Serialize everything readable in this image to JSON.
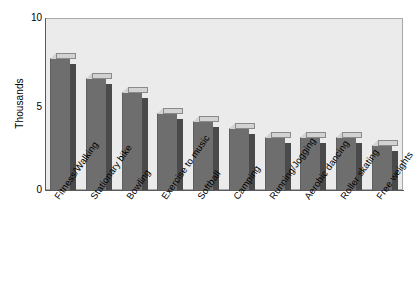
{
  "chart_data": {
    "type": "bar",
    "title": "",
    "subtitle": "",
    "xlabel": "",
    "ylabel": "Thousands",
    "ylim": [
      0,
      10
    ],
    "yticks": [
      0,
      5,
      10
    ],
    "ytick_labels": [
      "0",
      "5",
      "10"
    ],
    "grid": false,
    "legend": false,
    "legend_position": "none",
    "categories": [
      "Fitness/Walking",
      "Stationary bike",
      "Bowling",
      "Exercise to music",
      "Softball",
      "Camping",
      "Running/Jogging",
      "Aerobic dancing",
      "Roller skating",
      "Free weights"
    ],
    "values": [
      7.7,
      6.5,
      5.7,
      4.5,
      4.0,
      3.6,
      3.1,
      3.1,
      3.1,
      2.6
    ],
    "bar_style": "3d",
    "colors": {
      "bar_front": "#6e6e6e",
      "bar_side": "#4a4a4a",
      "bar_top": "#d2d2d2",
      "plot_background": "#ebebeb",
      "plot_border": "#a8a8a8",
      "axis": "#5a5a5a",
      "text": "#000000",
      "page_background": "#ffffff"
    }
  },
  "axis": {
    "y_title": "Thousands",
    "y_tick_0": "0",
    "y_tick_1": "5",
    "y_tick_2": "10"
  }
}
